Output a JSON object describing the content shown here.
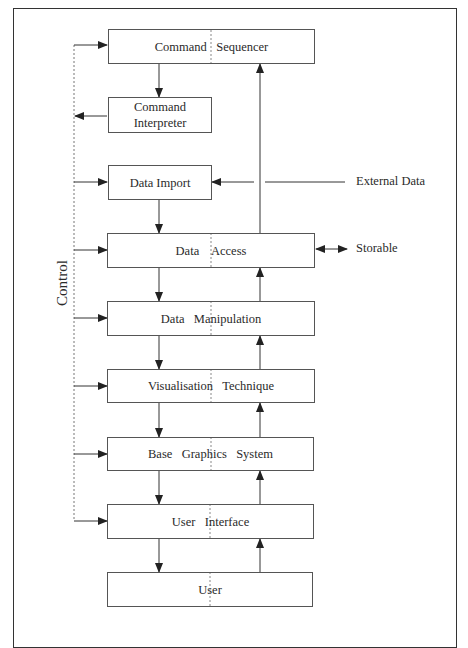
{
  "diagram": {
    "side_label": "Control",
    "external_inputs": {
      "external_data": "External Data",
      "storable": "Storable"
    },
    "boxes": [
      {
        "id": "command-sequencer",
        "label": "Command   Sequencer"
      },
      {
        "id": "command-interpreter",
        "label": "Command\nInterpreter"
      },
      {
        "id": "data-import",
        "label": "Data Import"
      },
      {
        "id": "data-access",
        "label": "Data    Access"
      },
      {
        "id": "data-manipulation",
        "label": "Data   Manipulation"
      },
      {
        "id": "visualisation-technique",
        "label": "Visualisation   Technique"
      },
      {
        "id": "base-graphics-system",
        "label": "Base   Graphics   System"
      },
      {
        "id": "user-interface",
        "label": "User   Interface"
      },
      {
        "id": "user",
        "label": "User"
      }
    ],
    "colors": {
      "line": "#333333",
      "box_border": "#555555",
      "dashed": "#777777",
      "background": "#ffffff"
    }
  }
}
